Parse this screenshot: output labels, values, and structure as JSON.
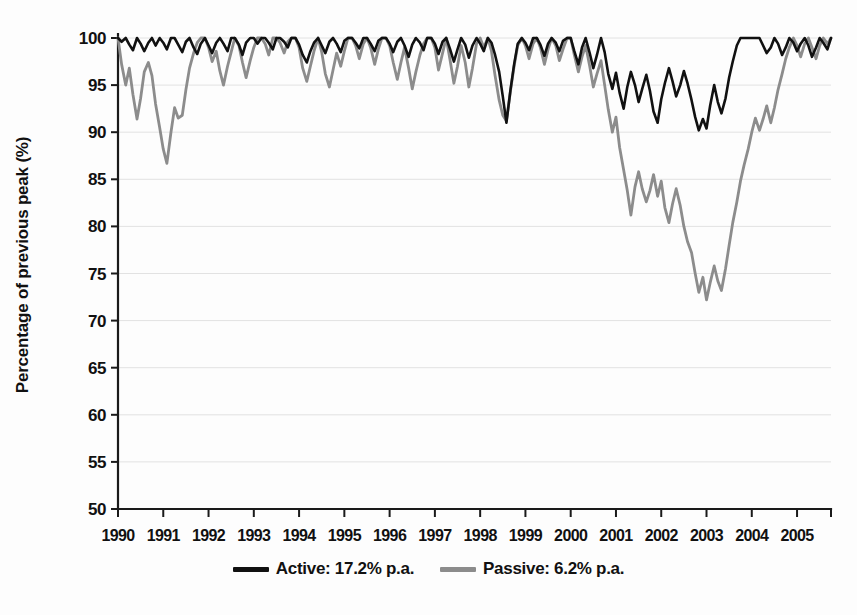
{
  "chart_data": {
    "type": "line",
    "title": "",
    "subtitle": "",
    "xlabel": "",
    "ylabel": "Percentage of previous peak (%)",
    "xlim": [
      1990,
      2005.75
    ],
    "ylim": [
      50,
      100
    ],
    "ytick_labels": [
      "100",
      "95",
      "90",
      "85",
      "80",
      "75",
      "70",
      "65",
      "60",
      "55",
      "50"
    ],
    "ytick_values": [
      100,
      95,
      90,
      85,
      80,
      75,
      70,
      65,
      60,
      55,
      50
    ],
    "xtick_labels": [
      "1990",
      "1991",
      "1992",
      "1993",
      "1994",
      "1995",
      "1996",
      "1997",
      "1998",
      "1999",
      "2000",
      "2001",
      "2002",
      "2003",
      "2004",
      "2005"
    ],
    "xtick_values": [
      1990,
      1991,
      1992,
      1993,
      1994,
      1995,
      1996,
      1997,
      1998,
      1999,
      2000,
      2001,
      2002,
      2003,
      2004,
      2005
    ],
    "grid": true,
    "grid_axis": "y",
    "legend_position": "bottom-center",
    "colors": {
      "active": "#111111",
      "passive": "#8c8c8c",
      "gridline": "#e2e2e2",
      "axis": "#1a1a1a",
      "background": "#fdfdfd"
    },
    "series": [
      {
        "name": "Active: 17.2% p.a.",
        "short_name": "Active",
        "return_label": "17.2% p.a.",
        "color": "#111111",
        "line_width": 2.6,
        "x": [
          1990.0,
          1990.08,
          1990.17,
          1990.25,
          1990.33,
          1990.42,
          1990.5,
          1990.58,
          1990.67,
          1990.75,
          1990.83,
          1990.92,
          1991.0,
          1991.08,
          1991.17,
          1991.25,
          1991.33,
          1991.42,
          1991.5,
          1991.58,
          1991.67,
          1991.75,
          1991.83,
          1991.92,
          1992.0,
          1992.08,
          1992.17,
          1992.25,
          1992.33,
          1992.42,
          1992.5,
          1992.58,
          1992.67,
          1992.75,
          1992.83,
          1992.92,
          1993.0,
          1993.08,
          1993.17,
          1993.25,
          1993.33,
          1993.42,
          1993.5,
          1993.58,
          1993.67,
          1993.75,
          1993.83,
          1993.92,
          1994.0,
          1994.08,
          1994.17,
          1994.25,
          1994.33,
          1994.42,
          1994.5,
          1994.58,
          1994.67,
          1994.75,
          1994.83,
          1994.92,
          1995.0,
          1995.08,
          1995.17,
          1995.25,
          1995.33,
          1995.42,
          1995.5,
          1995.58,
          1995.67,
          1995.75,
          1995.83,
          1995.92,
          1996.0,
          1996.08,
          1996.17,
          1996.25,
          1996.33,
          1996.42,
          1996.5,
          1996.58,
          1996.67,
          1996.75,
          1996.83,
          1996.92,
          1997.0,
          1997.08,
          1997.17,
          1997.25,
          1997.33,
          1997.42,
          1997.5,
          1997.58,
          1997.67,
          1997.75,
          1997.83,
          1997.92,
          1998.0,
          1998.08,
          1998.17,
          1998.25,
          1998.33,
          1998.42,
          1998.5,
          1998.58,
          1998.67,
          1998.75,
          1998.83,
          1998.92,
          1999.0,
          1999.08,
          1999.17,
          1999.25,
          1999.33,
          1999.42,
          1999.5,
          1999.58,
          1999.67,
          1999.75,
          1999.83,
          1999.92,
          2000.0,
          2000.08,
          2000.17,
          2000.25,
          2000.33,
          2000.42,
          2000.5,
          2000.58,
          2000.67,
          2000.75,
          2000.83,
          2000.92,
          2001.0,
          2001.08,
          2001.17,
          2001.25,
          2001.33,
          2001.42,
          2001.5,
          2001.58,
          2001.67,
          2001.75,
          2001.83,
          2001.92,
          2002.0,
          2002.08,
          2002.17,
          2002.25,
          2002.33,
          2002.42,
          2002.5,
          2002.58,
          2002.67,
          2002.75,
          2002.83,
          2002.92,
          2003.0,
          2003.08,
          2003.17,
          2003.25,
          2003.33,
          2003.42,
          2003.5,
          2003.58,
          2003.67,
          2003.75,
          2003.83,
          2003.92,
          2004.0,
          2004.08,
          2004.17,
          2004.25,
          2004.33,
          2004.42,
          2004.5,
          2004.58,
          2004.67,
          2004.75,
          2004.83,
          2004.92,
          2005.0,
          2005.08,
          2005.17,
          2005.25,
          2005.33,
          2005.42,
          2005.5,
          2005.58,
          2005.67,
          2005.75
        ],
        "values": [
          100,
          99.6,
          100,
          99.3,
          98.7,
          100,
          99.4,
          98.6,
          99.5,
          100,
          99.2,
          100,
          99.5,
          98.8,
          100,
          100,
          99.3,
          98.5,
          99.6,
          100,
          99.0,
          98.3,
          99.4,
          100,
          99.2,
          98.4,
          99.5,
          100,
          99.4,
          98.6,
          100,
          100,
          99.3,
          98.2,
          99.5,
          100,
          100,
          99.4,
          100,
          100,
          99.5,
          98.8,
          100,
          100,
          99.6,
          99.0,
          100,
          100,
          99.3,
          98.2,
          97.4,
          98.6,
          99.5,
          100,
          99.2,
          98.4,
          99.6,
          100,
          99.4,
          98.5,
          99.7,
          100,
          100,
          99.5,
          98.9,
          100,
          100,
          99.4,
          98.6,
          99.7,
          100,
          100,
          99.4,
          98.5,
          99.6,
          100,
          99.2,
          98.0,
          99.3,
          100,
          99.5,
          98.7,
          100,
          100,
          99.4,
          98.3,
          99.6,
          100,
          98.9,
          97.5,
          98.8,
          100,
          99.3,
          97.9,
          99.2,
          100,
          99.4,
          98.6,
          100,
          99.5,
          98.2,
          96.4,
          93.8,
          91.0,
          94.5,
          97.2,
          99.4,
          100,
          99.5,
          98.7,
          100,
          100,
          99.3,
          98.1,
          99.4,
          100,
          99.5,
          98.6,
          99.7,
          100,
          100,
          98.6,
          97.2,
          99.0,
          100,
          98.4,
          96.8,
          98.2,
          100,
          98.5,
          96.2,
          94.6,
          96.3,
          94.2,
          92.5,
          94.8,
          96.4,
          95.0,
          93.2,
          94.6,
          96.1,
          94.4,
          92.2,
          91.0,
          93.5,
          95.2,
          96.8,
          95.4,
          93.8,
          95.0,
          96.5,
          95.2,
          93.4,
          91.6,
          90.2,
          91.4,
          90.4,
          92.8,
          95.0,
          93.2,
          92.0,
          93.6,
          95.8,
          97.5,
          99.2,
          100,
          100,
          100,
          100,
          100,
          100,
          99.2,
          98.4,
          99.0,
          100,
          99.4,
          98.2,
          99.0,
          100,
          99.5,
          98.6,
          99.4,
          100,
          99.2,
          98.0,
          99.0,
          100,
          99.5,
          98.8,
          100
        ]
      },
      {
        "name": "Passive: 6.2% p.a.",
        "short_name": "Passive",
        "return_label": "6.2% p.a.",
        "color": "#8c8c8c",
        "line_width": 2.8,
        "x": [
          1990.0,
          1990.08,
          1990.17,
          1990.25,
          1990.33,
          1990.42,
          1990.5,
          1990.58,
          1990.67,
          1990.75,
          1990.83,
          1990.92,
          1991.0,
          1991.08,
          1991.17,
          1991.25,
          1991.33,
          1991.42,
          1991.5,
          1991.58,
          1991.67,
          1991.75,
          1991.83,
          1991.92,
          1992.0,
          1992.08,
          1992.17,
          1992.25,
          1992.33,
          1992.42,
          1992.5,
          1992.58,
          1992.67,
          1992.75,
          1992.83,
          1992.92,
          1993.0,
          1993.08,
          1993.17,
          1993.25,
          1993.33,
          1993.42,
          1993.5,
          1993.58,
          1993.67,
          1993.75,
          1993.83,
          1993.92,
          1994.0,
          1994.08,
          1994.17,
          1994.25,
          1994.33,
          1994.42,
          1994.5,
          1994.58,
          1994.67,
          1994.75,
          1994.83,
          1994.92,
          1995.0,
          1995.08,
          1995.17,
          1995.25,
          1995.33,
          1995.42,
          1995.5,
          1995.58,
          1995.67,
          1995.75,
          1995.83,
          1995.92,
          1996.0,
          1996.08,
          1996.17,
          1996.25,
          1996.33,
          1996.42,
          1996.5,
          1996.58,
          1996.67,
          1996.75,
          1996.83,
          1996.92,
          1997.0,
          1997.08,
          1997.17,
          1997.25,
          1997.33,
          1997.42,
          1997.5,
          1997.58,
          1997.67,
          1997.75,
          1997.83,
          1997.92,
          1998.0,
          1998.08,
          1998.17,
          1998.25,
          1998.33,
          1998.42,
          1998.5,
          1998.58,
          1998.67,
          1998.75,
          1998.83,
          1998.92,
          1999.0,
          1999.08,
          1999.17,
          1999.25,
          1999.33,
          1999.42,
          1999.5,
          1999.58,
          1999.67,
          1999.75,
          1999.83,
          1999.92,
          2000.0,
          2000.08,
          2000.17,
          2000.25,
          2000.33,
          2000.42,
          2000.5,
          2000.58,
          2000.67,
          2000.75,
          2000.83,
          2000.92,
          2001.0,
          2001.08,
          2001.17,
          2001.25,
          2001.33,
          2001.42,
          2001.5,
          2001.58,
          2001.67,
          2001.75,
          2001.83,
          2001.92,
          2002.0,
          2002.08,
          2002.17,
          2002.25,
          2002.33,
          2002.42,
          2002.5,
          2002.58,
          2002.67,
          2002.75,
          2002.83,
          2002.92,
          2003.0,
          2003.08,
          2003.17,
          2003.25,
          2003.33,
          2003.42,
          2003.5,
          2003.58,
          2003.67,
          2003.75,
          2003.83,
          2003.92,
          2004.0,
          2004.08,
          2004.17,
          2004.25,
          2004.33,
          2004.42,
          2004.5,
          2004.58,
          2004.67,
          2004.75,
          2004.83,
          2004.92,
          2005.0,
          2005.08,
          2005.17,
          2005.25,
          2005.33,
          2005.42,
          2005.5,
          2005.58,
          2005.67,
          2005.75
        ],
        "values": [
          100,
          97.2,
          95.0,
          96.8,
          94.0,
          91.4,
          93.6,
          96.4,
          97.4,
          96.0,
          93.0,
          90.5,
          88.2,
          86.7,
          90.0,
          92.6,
          91.5,
          91.8,
          94.5,
          96.8,
          98.4,
          99.5,
          100,
          100,
          99.0,
          97.5,
          98.6,
          96.5,
          95.0,
          97.0,
          98.5,
          100,
          99.2,
          97.4,
          95.8,
          97.6,
          99.0,
          100,
          100,
          99.4,
          98.2,
          100,
          100,
          99.5,
          98.4,
          99.6,
          100,
          100,
          99.0,
          96.8,
          95.4,
          97.0,
          98.6,
          100,
          98.5,
          96.2,
          94.8,
          96.6,
          98.4,
          97.0,
          98.6,
          100,
          100,
          99.2,
          97.8,
          99.4,
          100,
          99.0,
          97.2,
          98.8,
          100,
          100,
          99.2,
          97.4,
          95.6,
          97.4,
          99.0,
          96.8,
          94.6,
          96.4,
          98.2,
          99.4,
          100,
          100,
          99.0,
          96.6,
          98.4,
          100,
          97.8,
          95.2,
          97.0,
          99.2,
          97.4,
          94.8,
          96.8,
          99.4,
          100,
          99.0,
          100,
          98.6,
          96.0,
          93.4,
          91.8,
          91.2,
          94.4,
          97.0,
          99.2,
          100,
          99.2,
          97.8,
          99.4,
          100,
          99.0,
          97.2,
          98.8,
          100,
          99.2,
          97.6,
          98.8,
          100,
          100,
          98.2,
          96.4,
          98.0,
          99.2,
          97.0,
          94.8,
          96.2,
          97.6,
          95.0,
          92.4,
          90.0,
          91.6,
          88.4,
          86.0,
          83.8,
          81.2,
          84.2,
          85.8,
          84.0,
          82.6,
          83.8,
          85.5,
          83.2,
          84.8,
          82.0,
          80.4,
          82.4,
          84.0,
          82.2,
          80.0,
          78.4,
          77.2,
          75.0,
          73.0,
          74.6,
          72.2,
          74.0,
          75.8,
          74.2,
          73.2,
          75.5,
          78.0,
          80.4,
          82.6,
          84.8,
          86.5,
          88.2,
          90.0,
          91.5,
          90.2,
          91.4,
          92.8,
          91.0,
          92.6,
          94.5,
          96.2,
          97.8,
          99.0,
          100,
          99.2,
          98.0,
          99.4,
          100,
          99.0,
          97.8,
          99.2,
          100,
          99.4,
          100
        ]
      }
    ]
  },
  "legend": {
    "entries": [
      {
        "label": "Active: 17.2% p.a.",
        "color": "#111111"
      },
      {
        "label": "Passive: 6.2% p.a.",
        "color": "#8c8c8c"
      }
    ]
  },
  "axes": {
    "y_axis_title": "Percentage of previous peak (%)"
  }
}
